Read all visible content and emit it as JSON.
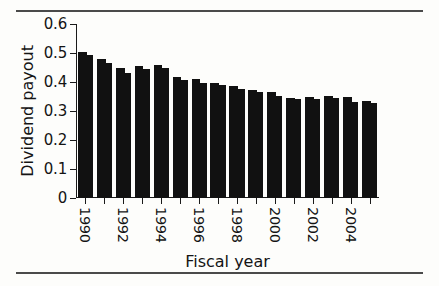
{
  "figure": {
    "background": "#fdfdfb",
    "rule_color": "#4a4a4a",
    "bar_color": "#111111"
  },
  "chart_data": {
    "type": "bar",
    "title": "",
    "subtitle": "",
    "xlabel": "Fiscal year",
    "ylabel": "Dividend payout",
    "categories": [
      "1990",
      "1991",
      "1992",
      "1993",
      "1994",
      "1995",
      "1996",
      "1997",
      "1998",
      "1999",
      "2000",
      "2001",
      "2002",
      "2003",
      "2004",
      "2005"
    ],
    "tick_labels": [
      "1990",
      "",
      "1992",
      "",
      "1994",
      "",
      "1996",
      "",
      "1998",
      "",
      "2000",
      "",
      "2002",
      "",
      "2004",
      ""
    ],
    "ylim": [
      0,
      0.6
    ],
    "yticks": [
      0,
      0.1,
      0.2,
      0.3,
      0.4,
      0.5,
      0.6
    ],
    "ytick_labels": [
      "0",
      "0.1",
      "0.2",
      "0.3",
      "0.4",
      "0.5",
      "0.6"
    ],
    "grid": false,
    "legend": "none",
    "series": [
      {
        "name": "left-subbar",
        "values": [
          0.505,
          0.479,
          0.449,
          0.456,
          0.459,
          0.419,
          0.409,
          0.396,
          0.386,
          0.374,
          0.366,
          0.346,
          0.349,
          0.351,
          0.349,
          0.333
        ]
      },
      {
        "name": "right-subbar",
        "values": [
          0.492,
          0.464,
          0.432,
          0.446,
          0.447,
          0.408,
          0.398,
          0.388,
          0.377,
          0.366,
          0.351,
          0.341,
          0.343,
          0.344,
          0.332,
          0.327
        ]
      }
    ],
    "values": [
      0.5,
      0.47,
      0.44,
      0.45,
      0.45,
      0.41,
      0.4,
      0.39,
      0.38,
      0.37,
      0.36,
      0.34,
      0.35,
      0.35,
      0.34,
      0.33
    ]
  }
}
